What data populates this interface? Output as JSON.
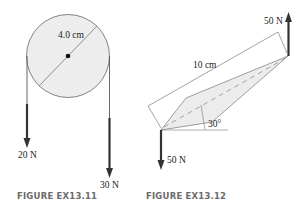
{
  "figures": [
    {
      "caption": "FIGURE EX13.11",
      "diameter_label": "4.0 cm",
      "forces": [
        {
          "label": "20 N",
          "side": "left",
          "direction": "down"
        },
        {
          "label": "30 N",
          "side": "right",
          "direction": "down"
        }
      ],
      "colors": {
        "disk_fill": "#ededed",
        "outline": "#555555",
        "arrow": "#333333"
      }
    },
    {
      "caption": "FIGURE EX13.12",
      "length_label": "10 cm",
      "angle_label": "30°",
      "forces": [
        {
          "label": "50 N",
          "end": "tip",
          "direction": "up"
        },
        {
          "label": "50 N",
          "end": "pivot",
          "direction": "down"
        }
      ],
      "colors": {
        "bar_fill": "#ececec",
        "outline": "#666666",
        "centerline": "#999999",
        "arrow": "#333333"
      }
    }
  ]
}
